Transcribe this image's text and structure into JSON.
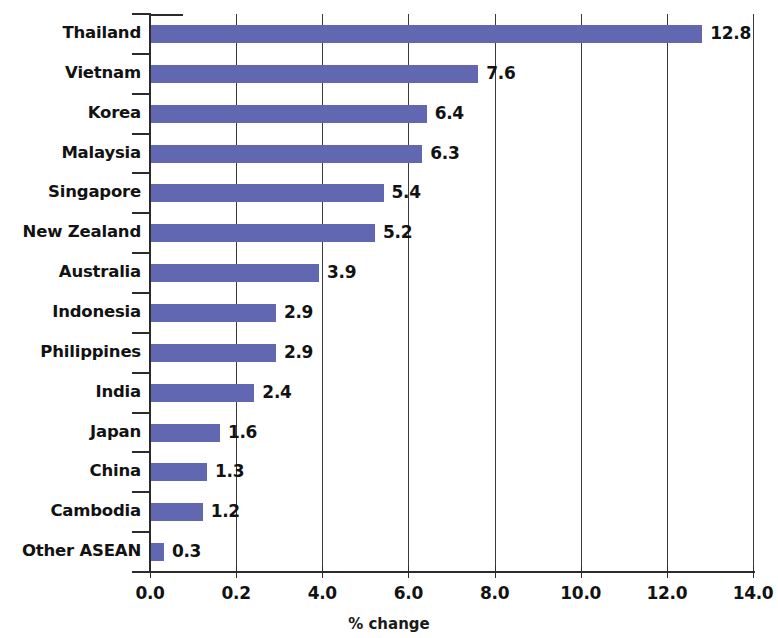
{
  "chart_data": {
    "type": "bar",
    "orientation": "horizontal",
    "title": "",
    "subtitle": "",
    "xlabel": "% change",
    "ylabel": "",
    "xlim": [
      0.0,
      14.0
    ],
    "grid": true,
    "legend": null,
    "bar_color": "#6167b0",
    "axis_color": "#2b2b2b",
    "text_color": "#121212",
    "categories": [
      "Thailand",
      "Vietnam",
      "Korea",
      "Malaysia",
      "Singapore",
      "New Zealand",
      "Australia",
      "Indonesia",
      "Philippines",
      "India",
      "Japan",
      "China",
      "Cambodia",
      "Other ASEAN"
    ],
    "values": [
      12.8,
      7.6,
      6.4,
      6.3,
      5.4,
      5.2,
      3.9,
      2.9,
      2.9,
      2.4,
      1.6,
      1.3,
      1.2,
      0.3
    ],
    "value_labels": [
      "12.8",
      "7.6",
      "6.4",
      "6.3",
      "5.4",
      "5.2",
      "3.9",
      "2.9",
      "2.9",
      "2.4",
      "1.6",
      "1.3",
      "1.2",
      "0.3"
    ],
    "xticks": [
      0.0,
      2.0,
      4.0,
      6.0,
      8.0,
      10.0,
      12.0,
      14.0
    ],
    "xtick_labels": [
      "0.0",
      "0.2",
      "4.0",
      "6.0",
      "8.0",
      "10.0",
      "12.0",
      "14.0"
    ]
  }
}
